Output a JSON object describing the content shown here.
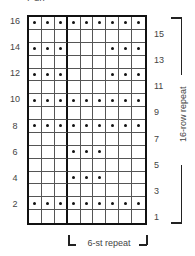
{
  "chart_data": {
    "type": "knitting-chart",
    "title": "Purl",
    "columns": 9,
    "rows": 16,
    "repeat_divider_after_column": 3,
    "dot_color": "#111111",
    "row_labels_left": [
      "16",
      "14",
      "12",
      "10",
      "8",
      "6",
      "4",
      "2"
    ],
    "row_labels_right": [
      "15",
      "13",
      "11",
      "9",
      "7",
      "5",
      "3",
      "1"
    ],
    "grid_top_to_bottom": [
      [
        1,
        1,
        1,
        1,
        1,
        1,
        1,
        1,
        1
      ],
      [
        0,
        0,
        0,
        0,
        0,
        0,
        0,
        0,
        0
      ],
      [
        1,
        1,
        1,
        0,
        0,
        0,
        1,
        1,
        1
      ],
      [
        0,
        0,
        0,
        0,
        0,
        0,
        0,
        0,
        0
      ],
      [
        1,
        1,
        1,
        0,
        0,
        0,
        1,
        1,
        1
      ],
      [
        0,
        0,
        0,
        0,
        0,
        0,
        0,
        0,
        0
      ],
      [
        1,
        1,
        1,
        1,
        1,
        1,
        1,
        1,
        1
      ],
      [
        0,
        0,
        0,
        0,
        0,
        0,
        0,
        0,
        0
      ],
      [
        1,
        1,
        1,
        1,
        1,
        1,
        1,
        1,
        1
      ],
      [
        0,
        0,
        0,
        0,
        0,
        0,
        0,
        0,
        0
      ],
      [
        0,
        0,
        0,
        1,
        1,
        1,
        0,
        0,
        0
      ],
      [
        0,
        0,
        0,
        0,
        0,
        0,
        0,
        0,
        0
      ],
      [
        0,
        0,
        0,
        1,
        1,
        1,
        0,
        0,
        0
      ],
      [
        0,
        0,
        0,
        0,
        0,
        0,
        0,
        0,
        0
      ],
      [
        1,
        1,
        1,
        1,
        1,
        1,
        1,
        1,
        1
      ],
      [
        0,
        0,
        0,
        0,
        0,
        0,
        0,
        0,
        0
      ]
    ],
    "row_repeat_label": "16-row repeat",
    "stitch_repeat_label": "6-st repeat"
  }
}
